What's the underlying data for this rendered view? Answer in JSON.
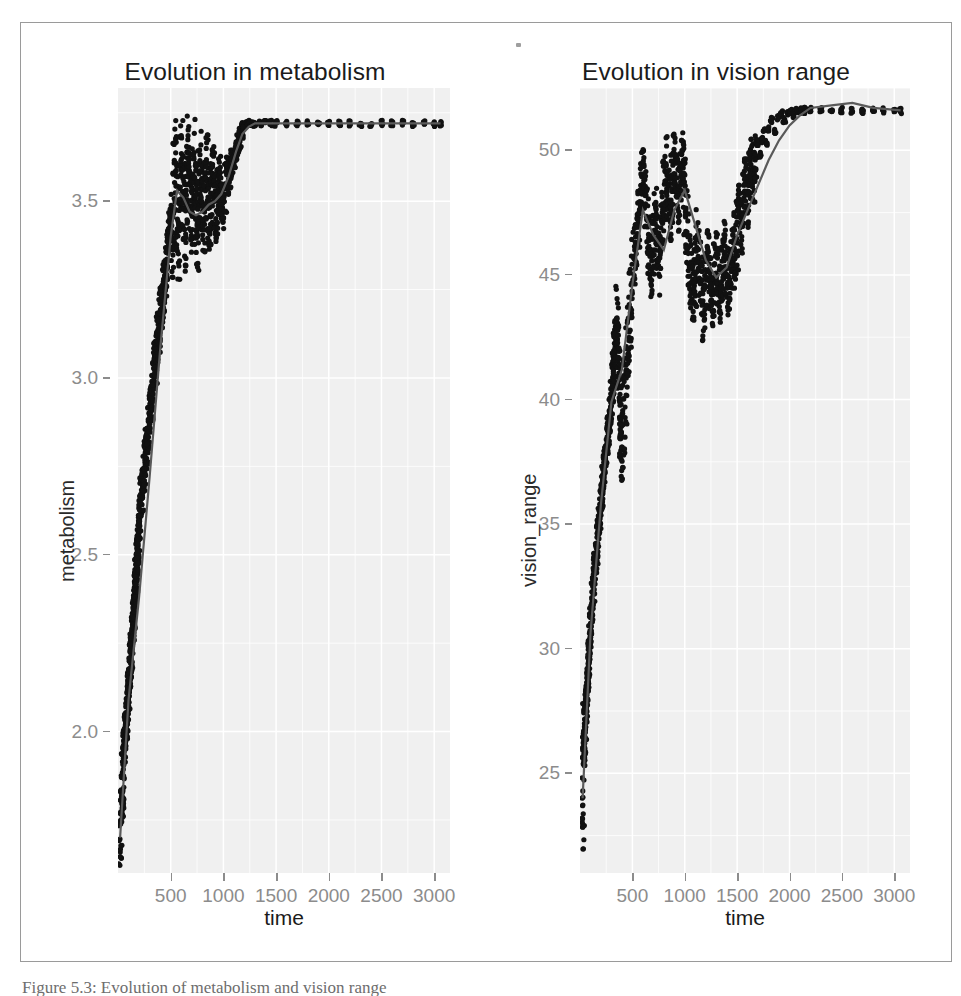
{
  "figure": {
    "caption": "Figure 5.3: Evolution of metabolism and vision range"
  },
  "chart_data": [
    {
      "type": "scatter",
      "title": "Evolution in metabolism",
      "xlabel": "time",
      "ylabel": "metabolism",
      "xlim": [
        0,
        3150
      ],
      "ylim": [
        1.6,
        3.82
      ],
      "xticks": [
        500,
        1000,
        1500,
        2000,
        2500,
        3000
      ],
      "yticks": [
        "2.0",
        "2.5",
        "3.0",
        "3.5"
      ],
      "ytick_values": [
        2.0,
        2.5,
        3.0,
        3.5
      ],
      "grid": true,
      "legend": "none",
      "point_color": "#111111",
      "smooth_color": "#5a5a5a",
      "panel_background": "#f0f0f0",
      "gridline_color": "#ffffff",
      "series": [
        {
          "name": "metabolism",
          "x": [
            20,
            30,
            40,
            45,
            55,
            60,
            70,
            75,
            80,
            85,
            90,
            95,
            100,
            105,
            110,
            115,
            120,
            125,
            130,
            135,
            140,
            145,
            150,
            155,
            160,
            165,
            170,
            175,
            180,
            185,
            190,
            195,
            200,
            210,
            220,
            230,
            240,
            250,
            260,
            270,
            280,
            290,
            300,
            310,
            320,
            330,
            340,
            350,
            360,
            370,
            380,
            390,
            400,
            410,
            420,
            430,
            440,
            450,
            460,
            470,
            480,
            490,
            500,
            515,
            530,
            545,
            560,
            575,
            590,
            605,
            620,
            635,
            650,
            665,
            680,
            695,
            710,
            725,
            740,
            755,
            770,
            785,
            800,
            815,
            830,
            845,
            860,
            875,
            890,
            905,
            920,
            935,
            950,
            965,
            980,
            1000,
            1020,
            1040,
            1060,
            1080,
            1100,
            1120,
            1140,
            1160,
            1180,
            1200,
            1220,
            1240,
            1260,
            1280,
            1300,
            1350,
            1400,
            1450,
            1500,
            1600,
            1700,
            1800,
            1900,
            2000,
            2100,
            2200,
            2300,
            2400,
            2500,
            2600,
            2700,
            2800,
            2900,
            3000,
            3060
          ],
          "y": [
            1.66,
            1.78,
            1.8,
            1.84,
            1.93,
            1.95,
            1.99,
            2.02,
            2.0,
            2.04,
            2.08,
            2.06,
            2.11,
            2.14,
            2.12,
            2.18,
            2.21,
            2.24,
            2.22,
            2.27,
            2.3,
            2.33,
            2.31,
            2.36,
            2.39,
            2.42,
            2.45,
            2.43,
            2.48,
            2.52,
            2.5,
            2.55,
            2.58,
            2.62,
            2.66,
            2.7,
            2.68,
            2.74,
            2.78,
            2.82,
            2.8,
            2.86,
            2.9,
            2.94,
            2.92,
            2.98,
            3.02,
            3.06,
            3.04,
            3.1,
            3.14,
            3.12,
            3.18,
            3.22,
            3.2,
            3.26,
            3.3,
            3.28,
            3.34,
            3.38,
            3.36,
            3.42,
            3.44,
            3.4,
            3.52,
            3.6,
            3.48,
            3.42,
            3.55,
            3.62,
            3.5,
            3.44,
            3.58,
            3.63,
            3.52,
            3.46,
            3.55,
            3.61,
            3.49,
            3.43,
            3.54,
            3.6,
            3.5,
            3.45,
            3.53,
            3.58,
            3.48,
            3.44,
            3.52,
            3.57,
            3.49,
            3.46,
            3.53,
            3.56,
            3.5,
            3.48,
            3.54,
            3.58,
            3.56,
            3.6,
            3.62,
            3.64,
            3.66,
            3.68,
            3.7,
            3.71,
            3.72,
            3.72,
            3.72,
            3.72,
            3.72,
            3.72,
            3.72,
            3.72,
            3.72,
            3.72,
            3.72,
            3.72,
            3.72,
            3.72,
            3.72,
            3.72,
            3.72,
            3.72,
            3.72,
            3.72,
            3.72,
            3.72,
            3.72,
            3.72,
            3.72
          ]
        }
      ],
      "smooth": {
        "name": "loess",
        "x": [
          20,
          100,
          200,
          300,
          400,
          500,
          560,
          620,
          680,
          740,
          800,
          860,
          920,
          980,
          1050,
          1120,
          1180,
          1240,
          1300,
          1400,
          1600,
          2000,
          2400,
          2800,
          3060
        ],
        "y": [
          1.7,
          2.09,
          2.38,
          2.72,
          3.08,
          3.4,
          3.53,
          3.51,
          3.47,
          3.46,
          3.47,
          3.49,
          3.5,
          3.52,
          3.57,
          3.64,
          3.69,
          3.71,
          3.72,
          3.72,
          3.72,
          3.72,
          3.72,
          3.72,
          3.72
        ]
      }
    },
    {
      "type": "scatter",
      "title": "Evolution in vision range",
      "xlabel": "time",
      "ylabel": "vision_range",
      "xlim": [
        0,
        3150
      ],
      "ylim": [
        21,
        52.5
      ],
      "xticks": [
        500,
        1000,
        1500,
        2000,
        2500,
        3000
      ],
      "yticks": [
        "25",
        "30",
        "35",
        "40",
        "45",
        "50"
      ],
      "ytick_values": [
        25,
        30,
        35,
        40,
        45,
        50
      ],
      "grid": true,
      "legend": "none",
      "point_color": "#111111",
      "smooth_color": "#5a5a5a",
      "panel_background": "#f0f0f0",
      "gridline_color": "#ffffff",
      "series": [
        {
          "name": "vision_range",
          "x": [
            25,
            30,
            35,
            40,
            45,
            50,
            55,
            60,
            65,
            70,
            75,
            80,
            85,
            90,
            95,
            100,
            110,
            120,
            130,
            140,
            150,
            160,
            170,
            180,
            190,
            200,
            210,
            220,
            230,
            240,
            250,
            260,
            270,
            280,
            290,
            300,
            310,
            320,
            330,
            340,
            350,
            360,
            370,
            380,
            390,
            400,
            420,
            440,
            460,
            480,
            500,
            520,
            540,
            560,
            580,
            600,
            620,
            640,
            660,
            680,
            700,
            720,
            740,
            760,
            780,
            800,
            820,
            840,
            860,
            880,
            900,
            920,
            940,
            960,
            980,
            1000,
            1020,
            1040,
            1060,
            1080,
            1100,
            1120,
            1140,
            1160,
            1180,
            1200,
            1220,
            1240,
            1260,
            1280,
            1300,
            1320,
            1340,
            1360,
            1380,
            1400,
            1420,
            1440,
            1460,
            1480,
            1500,
            1520,
            1540,
            1560,
            1580,
            1600,
            1620,
            1640,
            1660,
            1680,
            1700,
            1720,
            1740,
            1760,
            1780,
            1800,
            1830,
            1860,
            1890,
            1920,
            1950,
            1980,
            2010,
            2040,
            2070,
            2100,
            2150,
            2200,
            2300,
            2400,
            2500,
            2600,
            2700,
            2800,
            2900,
            3000,
            3060
          ],
          "y": [
            21.9,
            25.2,
            25.6,
            26.1,
            26.4,
            27.0,
            27.3,
            27.8,
            28.2,
            28.5,
            29.0,
            29.4,
            29.8,
            30.2,
            30.5,
            30.9,
            31.5,
            32.0,
            32.6,
            33.1,
            33.6,
            34.0,
            34.5,
            35.0,
            35.4,
            35.9,
            36.3,
            36.8,
            37.2,
            37.6,
            38.0,
            38.4,
            38.8,
            39.2,
            39.6,
            40.0,
            40.6,
            41.2,
            41.9,
            42.5,
            43.2,
            42.0,
            40.8,
            39.8,
            38.9,
            38.2,
            39.5,
            41.0,
            42.3,
            43.5,
            44.8,
            45.8,
            46.5,
            47.3,
            48.2,
            49.0,
            48.2,
            47.2,
            46.2,
            45.4,
            46.3,
            47.2,
            46.4,
            45.6,
            46.8,
            48.0,
            49.2,
            48.4,
            47.6,
            48.6,
            49.6,
            48.8,
            48.0,
            48.9,
            49.5,
            48.3,
            47.1,
            46.0,
            45.0,
            44.2,
            45.2,
            46.4,
            45.4,
            44.4,
            43.6,
            44.5,
            45.5,
            44.6,
            43.8,
            44.8,
            45.8,
            44.9,
            44.1,
            45.0,
            46.0,
            45.2,
            44.5,
            45.4,
            46.3,
            45.6,
            46.6,
            47.5,
            46.8,
            47.8,
            48.6,
            47.9,
            48.8,
            49.5,
            48.9,
            49.7,
            50.3,
            49.8,
            50.4,
            50.8,
            50.3,
            50.9,
            51.2,
            50.8,
            51.3,
            51.5,
            51.2,
            51.5,
            51.6,
            51.4,
            51.6,
            51.6,
            51.6,
            51.6,
            51.6,
            51.6,
            51.6,
            51.6,
            51.6,
            51.6,
            51.6,
            51.6,
            51.6
          ]
        }
      ],
      "smooth": {
        "name": "loess",
        "x": [
          25,
          100,
          200,
          300,
          400,
          500,
          600,
          700,
          800,
          900,
          1000,
          1100,
          1200,
          1300,
          1400,
          1500,
          1600,
          1700,
          1800,
          1900,
          2000,
          2100,
          2200,
          2400,
          2600,
          2800,
          3060
        ],
        "y": [
          24.0,
          30.6,
          35.8,
          39.9,
          41.2,
          44.6,
          47.6,
          46.6,
          46.0,
          47.6,
          48.4,
          47.0,
          45.6,
          44.9,
          45.3,
          46.6,
          47.6,
          48.6,
          49.6,
          50.4,
          51.0,
          51.4,
          51.7,
          51.8,
          51.9,
          51.7,
          51.6
        ]
      }
    }
  ]
}
